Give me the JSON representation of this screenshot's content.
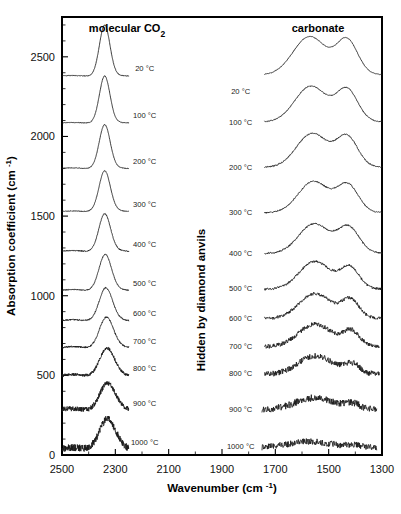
{
  "figure": {
    "panel_labels": {
      "left": "molecular CO2",
      "left_display": "molecular CO₂",
      "right": "carbonate"
    },
    "middle_note": "Hidden by diamond anvils",
    "axes": {
      "x": {
        "title": "Wavenumber (cm -1)",
        "title_display": "Wavenumber (cm ⁻¹)",
        "ticks": [
          2500,
          2300,
          2100,
          1900,
          1700,
          1500,
          1300
        ],
        "tick_labels": [
          "2500",
          "2300",
          "2100",
          "1900",
          "1700",
          "1500",
          "1300"
        ],
        "min": 1300,
        "max": 2500,
        "reversed": true,
        "minor_tick_step": 100
      },
      "y": {
        "title": "Absorption coefficient (cm -1)",
        "title_display": "Absorption coefficient (cm ⁻¹)",
        "ticks": [
          0,
          500,
          1000,
          1500,
          2000,
          2500
        ],
        "tick_labels": [
          "0",
          "500",
          "1000",
          "1500",
          "2000",
          "2500"
        ],
        "min": 0,
        "max": 2750,
        "minor_tick_step": 100
      }
    },
    "series_labels_left": [
      "20 °C",
      "100 °C",
      "200 °C",
      "300 °C",
      "400 °C",
      "500 °C",
      "600 °C",
      "700 °C",
      "800 °C",
      "900 °C",
      "1000 °C"
    ],
    "series_labels_right": [
      "20 °C",
      "100 °C",
      "200 °C",
      "300 °C",
      "400 °C",
      "500 °C",
      "600 °C",
      "700 °C",
      "800 °C",
      "900 °C",
      "1000 °C"
    ],
    "colors": {
      "line": "#1a1a1a",
      "frame": "#000000",
      "background": "#ffffff"
    }
  },
  "chart_data": {
    "type": "line",
    "title": "",
    "xlabel": "Wavenumber (cm -1)",
    "ylabel": "Absorption coefficient (cm -1)",
    "xlim": [
      2500,
      1300
    ],
    "ylim": [
      0,
      2750
    ],
    "x_reversed": true,
    "grid": false,
    "legend": "inline-right-of-each-trace",
    "series": [
      {
        "name": "20 °C",
        "group": "molecular CO2",
        "baseline": 2380,
        "peak_center": 2340,
        "peak_height": 320,
        "peak_width": 28,
        "noise": 2,
        "x_start": 2500,
        "x_end": 2250
      },
      {
        "name": "100 °C",
        "group": "molecular CO2",
        "baseline": 2085,
        "peak_center": 2340,
        "peak_height": 295,
        "peak_width": 28,
        "noise": 2,
        "x_start": 2500,
        "x_end": 2250
      },
      {
        "name": "200 °C",
        "group": "molecular CO2",
        "baseline": 1800,
        "peak_center": 2340,
        "peak_height": 275,
        "peak_width": 29,
        "noise": 2,
        "x_start": 2500,
        "x_end": 2250
      },
      {
        "name": "300 °C",
        "group": "molecular CO2",
        "baseline": 1530,
        "peak_center": 2340,
        "peak_height": 255,
        "peak_width": 30,
        "noise": 2,
        "x_start": 2500,
        "x_end": 2250
      },
      {
        "name": "400 °C",
        "group": "molecular CO2",
        "baseline": 1280,
        "peak_center": 2340,
        "peak_height": 235,
        "peak_width": 31,
        "noise": 3,
        "x_start": 2500,
        "x_end": 2250
      },
      {
        "name": "500 °C",
        "group": "molecular CO2",
        "baseline": 1035,
        "peak_center": 2338,
        "peak_height": 225,
        "peak_width": 33,
        "noise": 3,
        "x_start": 2500,
        "x_end": 2250
      },
      {
        "name": "600 °C",
        "group": "molecular CO2",
        "baseline": 845,
        "peak_center": 2336,
        "peak_height": 205,
        "peak_width": 35,
        "noise": 4,
        "x_start": 2500,
        "x_end": 2250
      },
      {
        "name": "700 °C",
        "group": "molecular CO2",
        "baseline": 675,
        "peak_center": 2334,
        "peak_height": 190,
        "peak_width": 37,
        "noise": 5,
        "x_start": 2500,
        "x_end": 2250
      },
      {
        "name": "800 °C",
        "group": "molecular CO2",
        "baseline": 500,
        "peak_center": 2332,
        "peak_height": 170,
        "peak_width": 39,
        "noise": 9,
        "x_start": 2500,
        "x_end": 2250
      },
      {
        "name": "900 °C",
        "group": "molecular CO2",
        "baseline": 285,
        "peak_center": 2330,
        "peak_height": 165,
        "peak_width": 41,
        "noise": 16,
        "x_start": 2500,
        "x_end": 2250
      },
      {
        "name": "1000 °C",
        "group": "molecular CO2",
        "baseline": 40,
        "peak_center": 2330,
        "peak_height": 185,
        "peak_width": 43,
        "noise": 22,
        "x_start": 2500,
        "x_end": 2250
      },
      {
        "name": "20 °C",
        "group": "carbonate",
        "baseline": 2385,
        "peaks": [
          {
            "c": 1575,
            "h": 215,
            "w": 85
          },
          {
            "c": 1430,
            "h": 195,
            "w": 55
          }
        ],
        "noise": 2,
        "x_start": 1740,
        "x_end": 1300
      },
      {
        "name": "100 °C",
        "group": "carbonate",
        "baseline": 2090,
        "peaks": [
          {
            "c": 1570,
            "h": 200,
            "w": 82
          },
          {
            "c": 1430,
            "h": 180,
            "w": 55
          }
        ],
        "noise": 3,
        "x_start": 1740,
        "x_end": 1300
      },
      {
        "name": "200 °C",
        "group": "carbonate",
        "baseline": 1805,
        "peaks": [
          {
            "c": 1565,
            "h": 190,
            "w": 80
          },
          {
            "c": 1430,
            "h": 170,
            "w": 55
          }
        ],
        "noise": 4,
        "x_start": 1740,
        "x_end": 1300
      },
      {
        "name": "300 °C",
        "group": "carbonate",
        "baseline": 1520,
        "peaks": [
          {
            "c": 1560,
            "h": 175,
            "w": 78
          },
          {
            "c": 1428,
            "h": 155,
            "w": 55
          }
        ],
        "noise": 4,
        "x_start": 1740,
        "x_end": 1300
      },
      {
        "name": "400 °C",
        "group": "carbonate",
        "baseline": 1265,
        "peaks": [
          {
            "c": 1558,
            "h": 165,
            "w": 78
          },
          {
            "c": 1425,
            "h": 145,
            "w": 55
          }
        ],
        "noise": 5,
        "x_start": 1740,
        "x_end": 1300
      },
      {
        "name": "500 °C",
        "group": "carbonate",
        "baseline": 1040,
        "peaks": [
          {
            "c": 1555,
            "h": 155,
            "w": 80
          },
          {
            "c": 1420,
            "h": 120,
            "w": 48
          }
        ],
        "noise": 7,
        "x_start": 1740,
        "x_end": 1300
      },
      {
        "name": "600 °C",
        "group": "carbonate",
        "baseline": 855,
        "peaks": [
          {
            "c": 1555,
            "h": 140,
            "w": 82
          },
          {
            "c": 1418,
            "h": 105,
            "w": 45
          }
        ],
        "noise": 10,
        "x_start": 1740,
        "x_end": 1300
      },
      {
        "name": "700 °C",
        "group": "carbonate",
        "baseline": 680,
        "peaks": [
          {
            "c": 1555,
            "h": 125,
            "w": 85
          },
          {
            "c": 1415,
            "h": 85,
            "w": 42
          }
        ],
        "noise": 14,
        "x_start": 1740,
        "x_end": 1310
      },
      {
        "name": "800 °C",
        "group": "carbonate",
        "baseline": 505,
        "peaks": [
          {
            "c": 1555,
            "h": 105,
            "w": 88
          },
          {
            "c": 1412,
            "h": 55,
            "w": 40
          }
        ],
        "noise": 18,
        "x_start": 1740,
        "x_end": 1310
      },
      {
        "name": "900 °C",
        "group": "carbonate",
        "baseline": 285,
        "peaks": [
          {
            "c": 1560,
            "h": 65,
            "w": 95
          },
          {
            "c": 1410,
            "h": 30,
            "w": 40
          }
        ],
        "noise": 22,
        "x_start": 1750,
        "x_end": 1320
      },
      {
        "name": "1000 °C",
        "group": "carbonate",
        "baseline": 45,
        "peaks": [
          {
            "c": 1580,
            "h": 35,
            "w": 110
          },
          {
            "c": 1400,
            "h": 12,
            "w": 40
          }
        ],
        "noise": 20,
        "x_start": 1750,
        "x_end": 1320
      }
    ],
    "label_positions_left": [
      {
        "label": "20 °C",
        "x": 2190,
        "y": 2410
      },
      {
        "label": "100 °C",
        "x": 2190,
        "y": 2115
      },
      {
        "label": "200 °C",
        "x": 2190,
        "y": 1830
      },
      {
        "label": "300 °C",
        "x": 2190,
        "y": 1558
      },
      {
        "label": "400 °C",
        "x": 2190,
        "y": 1305
      },
      {
        "label": "500 °C",
        "x": 2190,
        "y": 1062
      },
      {
        "label": "600 °C",
        "x": 2190,
        "y": 872
      },
      {
        "label": "700 °C",
        "x": 2190,
        "y": 700
      },
      {
        "label": "800 °C",
        "x": 2190,
        "y": 525
      },
      {
        "label": "900 °C",
        "x": 2190,
        "y": 310
      },
      {
        "label": "1000 °C",
        "x": 2190,
        "y": 65
      }
    ],
    "label_positions_right": [
      {
        "label": "20 °C",
        "x": 1830,
        "y": 2265
      },
      {
        "label": "100 °C",
        "x": 1830,
        "y": 2075
      },
      {
        "label": "200 °C",
        "x": 1830,
        "y": 1790
      },
      {
        "label": "300 °C",
        "x": 1830,
        "y": 1508
      },
      {
        "label": "400 °C",
        "x": 1830,
        "y": 1252
      },
      {
        "label": "500 °C",
        "x": 1830,
        "y": 1028
      },
      {
        "label": "600 °C",
        "x": 1830,
        "y": 843
      },
      {
        "label": "700 °C",
        "x": 1830,
        "y": 668
      },
      {
        "label": "800 °C",
        "x": 1830,
        "y": 495
      },
      {
        "label": "900 °C",
        "x": 1830,
        "y": 272
      },
      {
        "label": "1000 °C",
        "x": 1830,
        "y": 35
      }
    ]
  }
}
